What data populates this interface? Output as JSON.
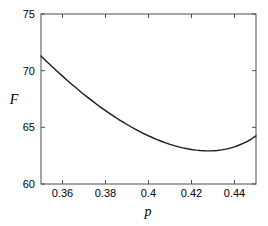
{
  "chart_data": {
    "type": "line",
    "title": "",
    "subtitle": "",
    "xlabel": "p",
    "ylabel": "F",
    "xlim": [
      0.35,
      0.45
    ],
    "ylim": [
      60,
      75
    ],
    "grid": false,
    "legend": null,
    "xticks": [
      0.36,
      0.38,
      0.4,
      0.42,
      0.44
    ],
    "xtick_labels": [
      "0.36",
      "0.38",
      "0.4",
      "0.42",
      "0.44"
    ],
    "yticks": [
      60,
      65,
      70,
      75
    ],
    "ytick_labels": [
      "60",
      "65",
      "70",
      "75"
    ],
    "line_color": "#1a1a1a",
    "axis_color": "#4d4d4d",
    "background_color": "#ffffff",
    "series": [
      {
        "name": "F(p)",
        "x": [
          0.35,
          0.352,
          0.354,
          0.356,
          0.358,
          0.36,
          0.362,
          0.364,
          0.366,
          0.368,
          0.37,
          0.372,
          0.374,
          0.376,
          0.378,
          0.38,
          0.382,
          0.384,
          0.386,
          0.388,
          0.39,
          0.392,
          0.394,
          0.396,
          0.398,
          0.4,
          0.402,
          0.404,
          0.406,
          0.408,
          0.41,
          0.412,
          0.414,
          0.416,
          0.418,
          0.42,
          0.422,
          0.424,
          0.426,
          0.428,
          0.43,
          0.432,
          0.434,
          0.436,
          0.438,
          0.44,
          0.442,
          0.444,
          0.446,
          0.448,
          0.45
        ],
        "y": [
          71.3,
          70.93,
          70.57,
          70.21,
          69.86,
          69.52,
          69.18,
          68.85,
          68.53,
          68.21,
          67.9,
          67.6,
          67.31,
          67.02,
          66.74,
          66.47,
          66.21,
          65.96,
          65.71,
          65.48,
          65.25,
          65.03,
          64.82,
          64.62,
          64.43,
          64.25,
          64.08,
          63.92,
          63.77,
          63.63,
          63.5,
          63.38,
          63.28,
          63.19,
          63.11,
          63.04,
          62.99,
          62.95,
          62.93,
          62.92,
          62.93,
          62.96,
          63.01,
          63.08,
          63.17,
          63.28,
          63.42,
          63.58,
          63.77,
          63.99,
          64.24
        ]
      }
    ],
    "annotations": [
      {
        "label": "minimum",
        "x": 0.429,
        "y": 62.92
      }
    ]
  },
  "axes": {
    "x_title": "p",
    "y_title": "F"
  }
}
